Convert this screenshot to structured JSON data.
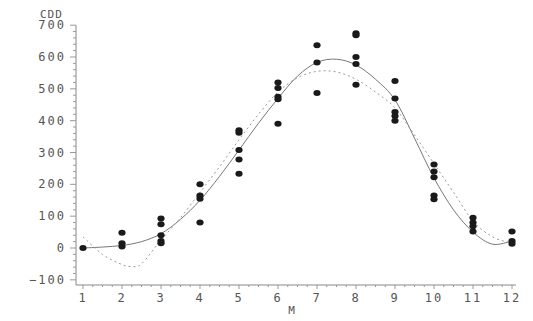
{
  "chart_data": {
    "type": "scatter",
    "title": "",
    "xlabel": "M",
    "ylabel": "CDD",
    "xlim": [
      1,
      12
    ],
    "ylim": [
      -100,
      700
    ],
    "x_ticks": [
      1,
      2,
      3,
      4,
      5,
      6,
      7,
      8,
      9,
      10,
      11,
      12
    ],
    "y_ticks": [
      -100,
      0,
      100,
      200,
      300,
      400,
      500,
      600,
      700
    ],
    "grid": false,
    "legend": null,
    "series": [
      {
        "name": "observed",
        "style": "points",
        "points": [
          [
            1,
            0
          ],
          [
            2,
            48
          ],
          [
            2,
            15
          ],
          [
            2,
            5
          ],
          [
            3,
            93
          ],
          [
            3,
            75
          ],
          [
            3,
            40
          ],
          [
            3,
            22
          ],
          [
            3,
            15
          ],
          [
            4,
            200
          ],
          [
            4,
            165
          ],
          [
            4,
            155
          ],
          [
            4,
            80
          ],
          [
            5,
            370
          ],
          [
            5,
            362
          ],
          [
            5,
            308
          ],
          [
            5,
            278
          ],
          [
            5,
            233
          ],
          [
            6,
            520
          ],
          [
            6,
            503
          ],
          [
            6,
            475
          ],
          [
            6,
            467
          ],
          [
            6,
            390
          ],
          [
            7,
            637
          ],
          [
            7,
            583
          ],
          [
            7,
            487
          ],
          [
            8,
            675
          ],
          [
            8,
            668
          ],
          [
            8,
            600
          ],
          [
            8,
            578
          ],
          [
            8,
            513
          ],
          [
            9,
            525
          ],
          [
            9,
            470
          ],
          [
            9,
            427
          ],
          [
            9,
            415
          ],
          [
            9,
            400
          ],
          [
            10,
            262
          ],
          [
            10,
            240
          ],
          [
            10,
            222
          ],
          [
            10,
            165
          ],
          [
            10,
            153
          ],
          [
            11,
            95
          ],
          [
            11,
            80
          ],
          [
            11,
            68
          ],
          [
            11,
            52
          ],
          [
            12,
            52
          ],
          [
            12,
            22
          ],
          [
            12,
            13
          ]
        ]
      },
      {
        "name": "fit-solid",
        "style": "solid-line",
        "x": [
          1,
          1.5,
          2,
          2.5,
          3,
          3.5,
          4,
          4.5,
          5,
          5.5,
          6,
          6.5,
          7,
          7.5,
          8,
          8.5,
          9,
          9.5,
          10,
          10.5,
          11,
          11.5,
          12
        ],
        "values": [
          0,
          3,
          8,
          20,
          45,
          90,
          150,
          225,
          308,
          392,
          470,
          540,
          583,
          593,
          575,
          530,
          465,
          345,
          220,
          120,
          50,
          12,
          22
        ]
      },
      {
        "name": "fit-dashed",
        "style": "dotted-line",
        "x": [
          1,
          1.5,
          2,
          2.25,
          2.5,
          3,
          3.5,
          4,
          4.5,
          5,
          5.5,
          6,
          6.5,
          7,
          7.5,
          8,
          8.5,
          9,
          9.5,
          10,
          10.5,
          11,
          11.5,
          12
        ],
        "values": [
          35,
          -20,
          -52,
          -58,
          -50,
          25,
          95,
          175,
          255,
          340,
          420,
          490,
          535,
          555,
          553,
          530,
          490,
          440,
          355,
          265,
          175,
          85,
          35,
          15
        ]
      }
    ]
  }
}
